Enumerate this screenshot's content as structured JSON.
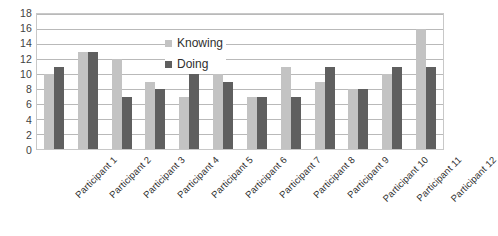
{
  "chart_data": {
    "type": "bar",
    "title": "",
    "xlabel": "",
    "ylabel": "",
    "ylim": [
      0,
      18
    ],
    "ytick_step": 2,
    "yticks": [
      18,
      16,
      14,
      12,
      10,
      8,
      6,
      4,
      2,
      0
    ],
    "grid": true,
    "grid_axis": "y",
    "legend_position": "inside-upper-center",
    "categories": [
      "Participant 1",
      "Participant 2",
      "Participant 3",
      "Participant 4",
      "Participant 5",
      "Participant 6",
      "Participant 7",
      "Participant 8",
      "Participant 9",
      "Participant 10",
      "Participant 11",
      "Participant 12"
    ],
    "series": [
      {
        "name": "Knowing",
        "color": "#c3c3c3",
        "values": [
          10,
          13,
          12,
          9,
          7,
          10,
          7,
          11,
          9,
          8,
          10,
          16
        ]
      },
      {
        "name": "Doing",
        "color": "#5f5f5f",
        "values": [
          11,
          13,
          7,
          8,
          11,
          9,
          7,
          7,
          11,
          8,
          11,
          11
        ]
      }
    ]
  },
  "legend": {
    "entries": [
      {
        "label": "Knowing",
        "color": "#c3c3c3"
      },
      {
        "label": "Doing",
        "color": "#5f5f5f"
      }
    ]
  },
  "caption": {
    "text": ""
  },
  "colors": {
    "knowing": "#c3c3c3",
    "doing": "#5f5f5f",
    "gridline": "#b9b9b9",
    "plot_border": "#c8c8c8",
    "background": "#ffffff",
    "tick_text": "#3f3f3f"
  }
}
